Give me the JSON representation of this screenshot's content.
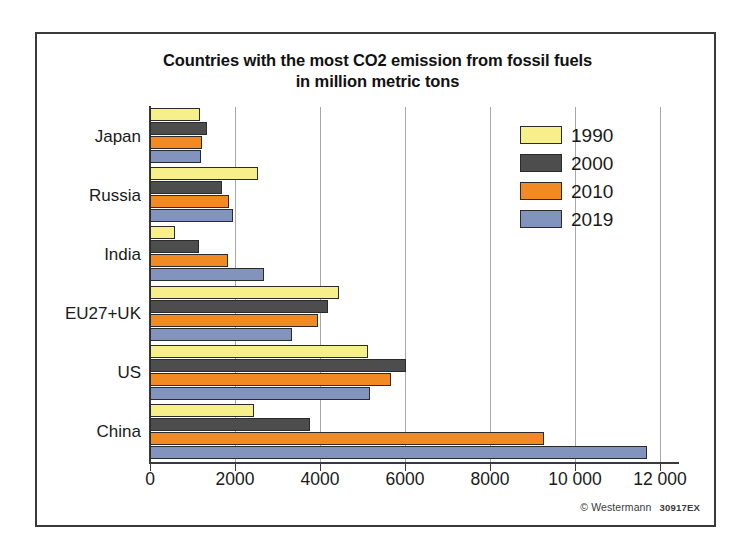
{
  "chart_data": {
    "type": "bar",
    "orientation": "horizontal",
    "title": "Countries with the most CO2 emission from fossil fuels in million metric tons",
    "title_lines": [
      "Countries with the most CO2 emission from fossil fuels",
      "in million metric tons"
    ],
    "xlabel": "",
    "ylabel": "",
    "xlim": [
      0,
      12000
    ],
    "xticks": [
      0,
      2000,
      4000,
      6000,
      8000,
      10000,
      12000
    ],
    "xtick_labels": [
      "0",
      "2000",
      "4000",
      "6000",
      "8000",
      "10 000",
      "12 000"
    ],
    "grid": true,
    "grid_axis": "x",
    "legend_position": "top-right",
    "categories": [
      "Japan",
      "Russia",
      "India",
      "EU27+UK",
      "US",
      "China"
    ],
    "series": [
      {
        "name": "1990",
        "color": "#F7F08A",
        "values": [
          1170,
          2540,
          590,
          4440,
          5120,
          2440
        ]
      },
      {
        "name": "2000",
        "color": "#4D4D4D",
        "values": [
          1350,
          1700,
          1150,
          4190,
          6020,
          3760
        ]
      },
      {
        "name": "2010",
        "color": "#F18A22",
        "values": [
          1220,
          1850,
          1830,
          3950,
          5660,
          9270
        ]
      },
      {
        "name": "2019",
        "color": "#8294BE",
        "values": [
          1200,
          1950,
          2680,
          3340,
          5170,
          11700
        ]
      }
    ],
    "credit": "© Westermann",
    "credit_code": "30917EX",
    "colors": {
      "frame": "#3a3a3a",
      "gridline": "#a8a8a8",
      "bar_outline": "#2b2b2b",
      "text": "#1a1a1a",
      "background": "#ffffff"
    }
  }
}
